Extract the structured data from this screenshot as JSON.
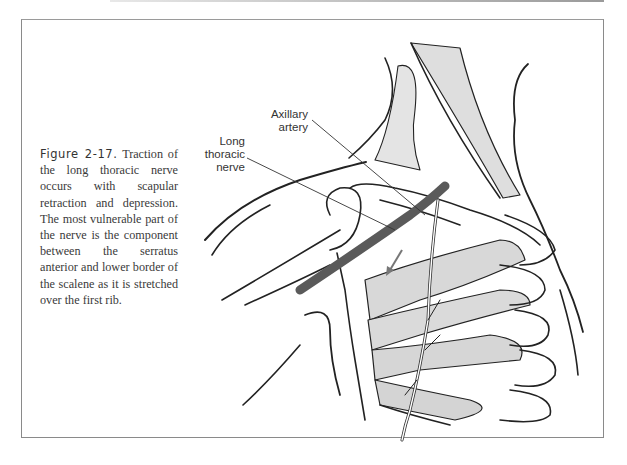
{
  "figure": {
    "number_label": "Figure 2-17.",
    "caption": "Traction of the long thoracic nerve occurs with scapular retraction and depression. The most vulnerable part of the nerve is the component between the serratus anterior and lower border of the scalene as it is stretched over the first rib."
  },
  "labels": {
    "axillary_artery": [
      "Axillary",
      "artery"
    ],
    "long_thoracic_nerve": [
      "Long",
      "thoracic",
      "nerve"
    ]
  },
  "colors": {
    "frame": "#8a8a8a",
    "artery": "#5a5a5a",
    "muscle_fill": "#dcdcdc",
    "arrow": "#777777"
  }
}
